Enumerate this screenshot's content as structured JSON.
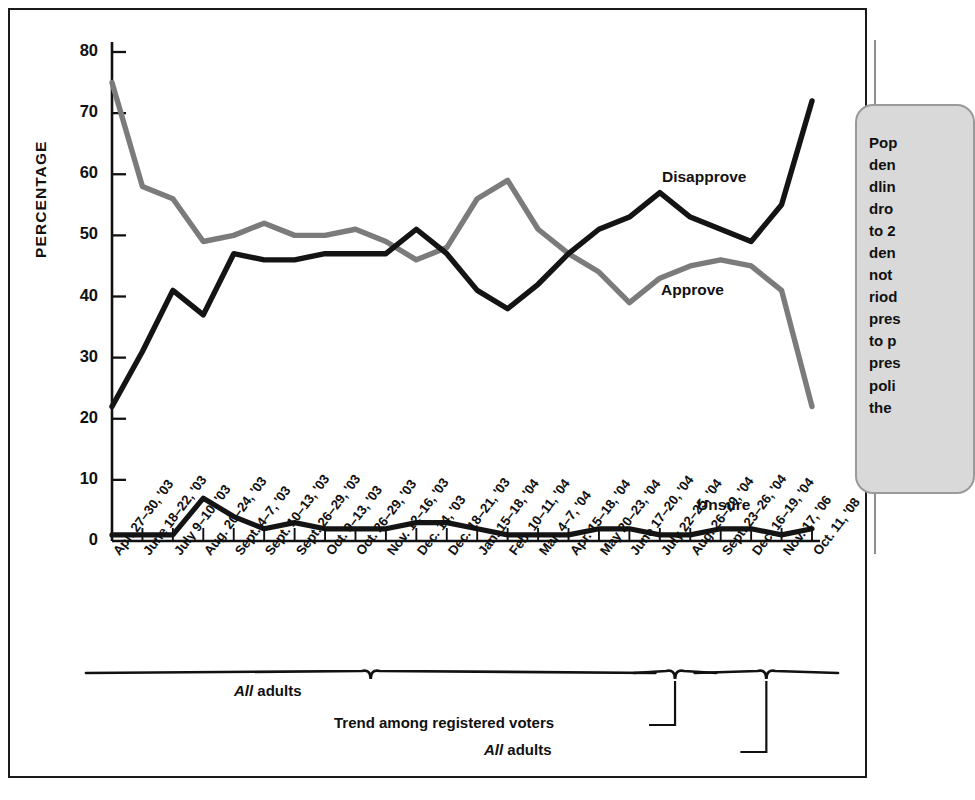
{
  "chart_data": {
    "type": "line",
    "title": "",
    "xlabel": "",
    "ylabel": "PERCENTAGE",
    "ylim": [
      0,
      80
    ],
    "yticks": [
      0,
      10,
      20,
      30,
      40,
      50,
      60,
      70,
      80
    ],
    "grid": false,
    "legend_position": "inline-annotations",
    "categories": [
      "Apr. 27–30, '03",
      "June 18–22, '03",
      "July 9–10, '03",
      "Aug. 20–24, '03",
      "Sept. 4–7, '03",
      "Sept. 10–13, '03",
      "Sept. 26–29, '03",
      "Oct. 9–13, '03",
      "Oct. 26–29, '03",
      "Nov. 12–16, '03",
      "Dec. 14, '03",
      "Dec. 18–21, '03",
      "Jan. 15–18, '04",
      "Feb. 10–11, '04",
      "Mar. 4–7, '04",
      "Apr. 15–18, '04",
      "May 20–23, '04",
      "June 17–20, '04",
      "July 22–25, '04",
      "Aug. 26–29, '04",
      "Sept. 23–26, '04",
      "Dec. 16–19, '04",
      "Nov. 17, '06",
      "Oct. 11, '08"
    ],
    "series": [
      {
        "name": "Approve",
        "color": "#7b7b7b",
        "values": [
          75,
          58,
          56,
          49,
          50,
          52,
          50,
          50,
          51,
          49,
          46,
          48,
          56,
          59,
          51,
          47,
          44,
          39,
          43,
          45,
          46,
          45,
          41,
          22
        ]
      },
      {
        "name": "Disapprove",
        "color": "#141414",
        "values": [
          22,
          31,
          41,
          37,
          47,
          46,
          46,
          47,
          47,
          47,
          51,
          47,
          41,
          38,
          42,
          47,
          51,
          53,
          57,
          53,
          51,
          49,
          55,
          72
        ]
      },
      {
        "name": "Unsure",
        "color": "#141414",
        "values": [
          1,
          1,
          1,
          7,
          4,
          2,
          3,
          2,
          2,
          2,
          3,
          3,
          2,
          1,
          1,
          1,
          2,
          2,
          1,
          1,
          2,
          2,
          1,
          2
        ]
      }
    ],
    "annotations": [
      {
        "name": "Disapprove",
        "label": "Disapprove"
      },
      {
        "name": "Approve",
        "label": "Approve"
      },
      {
        "name": "Unsure",
        "label": "Unsure"
      }
    ],
    "brackets": [
      {
        "label_italic": "All",
        "label_rest": " adults",
        "from": 0,
        "to": 17
      },
      {
        "label_italic": "",
        "label_rest": "Trend among registered voters",
        "from": 18,
        "to": 19
      },
      {
        "label_italic": "All",
        "label_rest": " adults",
        "from": 20,
        "to": 23
      }
    ]
  },
  "axis": {
    "y_title": "PERCENTAGE",
    "y_ticks": [
      "80",
      "70",
      "60",
      "50",
      "40",
      "30",
      "20",
      "10",
      "0"
    ]
  },
  "series_labels": {
    "disapprove": "Disapprove",
    "approve": "Approve",
    "unsure": "Unsure"
  },
  "bracket_labels": {
    "all_adults_1_italic": "All",
    "all_adults_1_rest": " adults",
    "registered_voters": "Trend among registered voters",
    "all_adults_2_italic": "All",
    "all_adults_2_rest": " adults"
  },
  "callout": {
    "text": "Pop\nden\ndlin\ndro\nto 2\nden\nnot\nriod\npres\nto p\npres\npoli\nthe"
  }
}
